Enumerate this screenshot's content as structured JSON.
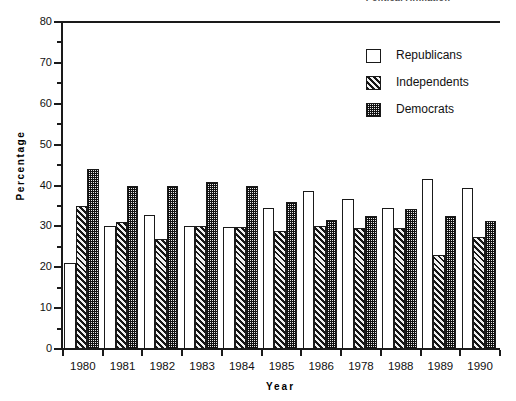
{
  "top_caption": "Political Affiliation",
  "chart_data": {
    "type": "bar",
    "title": "",
    "xlabel": "Year",
    "ylabel": "Percentage",
    "ylim": [
      0,
      80
    ],
    "yticks": [
      0,
      10,
      20,
      30,
      40,
      50,
      60,
      70,
      80
    ],
    "yminorticks": [
      5,
      15,
      25,
      35,
      45,
      55,
      65,
      75
    ],
    "ytick_labels": [
      "0",
      "10",
      "20",
      "30",
      "40",
      "50",
      "60",
      "70",
      "80"
    ],
    "grid": false,
    "legend_position": "upper right",
    "categories": [
      "1980",
      "1981",
      "1982",
      "1983",
      "1984",
      "1985",
      "1986",
      "1978",
      "1988",
      "1989",
      "1990"
    ],
    "series": [
      {
        "name": "Republicans",
        "fill": "white",
        "values": [
          21.0,
          30.0,
          32.8,
          30.0,
          29.8,
          34.5,
          38.7,
          36.7,
          34.5,
          41.5,
          39.5
        ]
      },
      {
        "name": "Independents",
        "fill": "diagonal-hatch",
        "values": [
          35.0,
          31.0,
          27.0,
          30.0,
          29.8,
          28.8,
          30.0,
          29.5,
          29.5,
          23.0,
          27.3
        ]
      },
      {
        "name": "Democrats",
        "fill": "stipple-dark",
        "values": [
          44.0,
          40.0,
          40.0,
          40.8,
          39.8,
          36.0,
          31.5,
          32.5,
          34.3,
          32.5,
          31.3
        ]
      }
    ]
  },
  "legend": {
    "items": [
      {
        "label": "Republicans"
      },
      {
        "label": "Independents"
      },
      {
        "label": "Democrats"
      }
    ]
  },
  "colors": {
    "axis": "#1a1a1a",
    "republicans": "#ffffff",
    "independents": "#3a3a3a",
    "democrats": "#555555",
    "background": "#ffffff"
  }
}
